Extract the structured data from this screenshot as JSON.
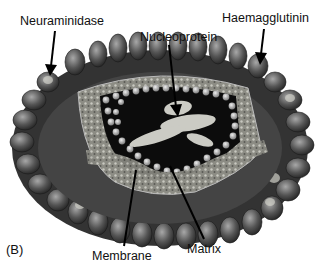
{
  "figure": {
    "panel_letter": "(B)",
    "labels": {
      "neuraminidase": "Neuraminidase",
      "haemagglutinin": "Haemagglutinin",
      "nucleoprotein": "Nucleoprotein",
      "membrane": "Membrane",
      "matrix": "Matrix"
    },
    "colors": {
      "background": "#ffffff",
      "text": "#111111",
      "spike_dark": "#3a3a3a",
      "spike_light": "#8a8a8a",
      "membrane": "#9a9a8e",
      "interior": "#0c0c0c",
      "matrix_beads": "#b8b8b0",
      "nucleoprotein": "#d8d8d0"
    }
  }
}
